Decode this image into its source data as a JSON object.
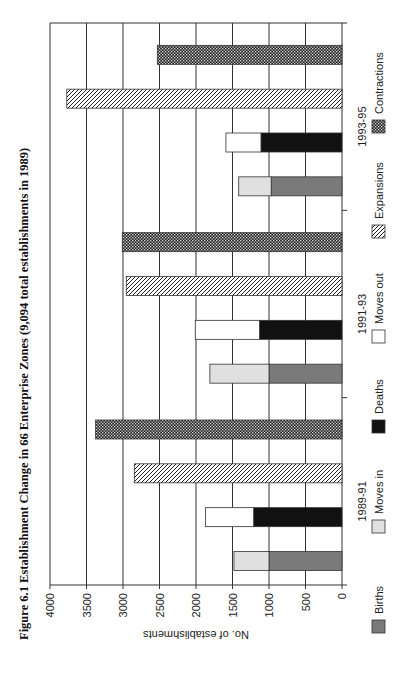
{
  "chart_data": {
    "type": "bar",
    "orientation": "horizontal-rotated",
    "title": "Figure 6.1  Establishment Change in 66 Enterprise Zones (9,094 total establishments in 1989)",
    "xlabel": "",
    "ylabel": "No. of establishments",
    "ylim": [
      0,
      4000
    ],
    "yticks": [
      "0",
      "500",
      "1000",
      "1500",
      "2000",
      "2500",
      "3000",
      "3500",
      "4000"
    ],
    "grid": true,
    "categories": [
      "1989-91",
      "1991-93",
      "1993-95"
    ],
    "series": [
      {
        "name": "Births",
        "stack": "entries",
        "color": "#7a7a7a",
        "pattern": "solid",
        "values": [
          1000,
          1000,
          970
        ]
      },
      {
        "name": "Moves in",
        "stack": "entries",
        "color": "#e0e0e0",
        "pattern": "solid",
        "values": [
          480,
          810,
          445
        ]
      },
      {
        "name": "Deaths",
        "stack": "exits",
        "color": "#111111",
        "pattern": "solid",
        "values": [
          1210,
          1130,
          1110
        ]
      },
      {
        "name": "Moves out",
        "stack": "exits",
        "color": "#ffffff",
        "pattern": "solid",
        "values": [
          660,
          880,
          480
        ]
      },
      {
        "name": "Expansions",
        "stack": "expansions",
        "color": "#ffffff",
        "pattern": "hatch",
        "values": [
          2845,
          2955,
          3770
        ]
      },
      {
        "name": "Contractions",
        "stack": "contractions",
        "color": "#333333",
        "pattern": "checker",
        "values": [
          3375,
          3010,
          2530
        ]
      }
    ],
    "legend": {
      "position": "bottom",
      "entries": [
        "Births",
        "Moves in",
        "Deaths",
        "Moves out",
        "Expansions",
        "Contractions"
      ]
    }
  }
}
